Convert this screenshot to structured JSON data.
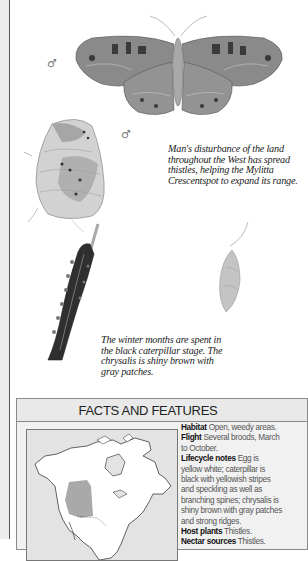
{
  "illustrations": {
    "adult_upperside": {
      "label": "Mylitta Crescentspot adult, upperside",
      "symbol": "♂"
    },
    "adult_underside": {
      "label": "Mylitta Crescentspot adult, underside",
      "symbol": "♂"
    },
    "caterpillar": {
      "label": "Black caterpillar on stem"
    },
    "chrysalis": {
      "label": "Hanging chrysalis"
    }
  },
  "captions": {
    "range_caption": [
      "Man's disturbance of the land",
      "throughout the West has spread",
      "thistles, helping the Mylitta",
      "Crescentspot to expand its range."
    ],
    "winter_caption": [
      "The winter months are spent in",
      "the black caterpillar stage. The",
      "chrysalis is shiny brown with",
      "gray patches."
    ]
  },
  "facts": {
    "title": "FACTS AND FEATURES",
    "map": {
      "label": "North America range map",
      "range_color": "#a9a9a9",
      "land_color": "#ffffff",
      "water_color": "#e3e3e3"
    },
    "items": [
      {
        "label": "Habitat",
        "lines": [
          " Open, weedy areas."
        ]
      },
      {
        "label": "Flight",
        "lines": [
          " Several broods, March",
          "to October."
        ]
      },
      {
        "label": "Lifecycle notes",
        "lines": [
          " Egg is",
          "yellow white; caterpillar is",
          "black with yellowish stripes",
          "and speckling as well as",
          "branching spines; chrysalis is",
          "shiny brown with gray patches",
          "and strong ridges."
        ]
      },
      {
        "label": "Host plants",
        "lines": [
          " Thistles."
        ]
      },
      {
        "label": "Nectar sources",
        "lines": [
          " Thistles."
        ]
      }
    ]
  },
  "colors": {
    "left_strip": "#ededed",
    "rule": "#555555",
    "header_band": "#e9e9e9"
  }
}
